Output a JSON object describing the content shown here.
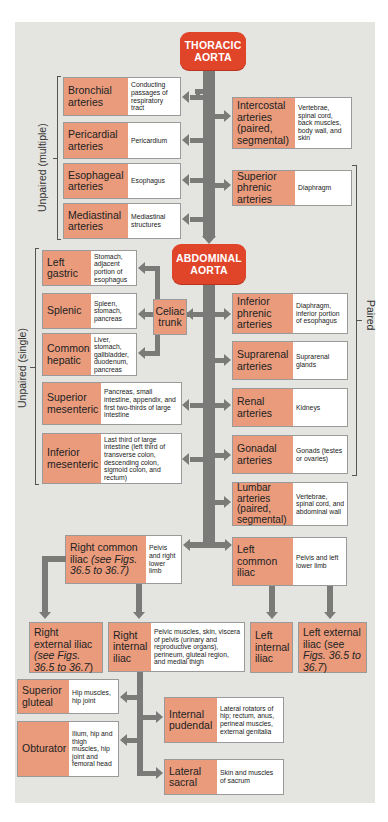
{
  "colors": {
    "aorta_fill": "#e0452a",
    "artery_name_fill": "#e99b7c",
    "description_fill": "#ffffff",
    "arrow": "#7a7a78",
    "background_panel": "#e4e4e0"
  },
  "thoracic_aorta": {
    "label_line1": "THORACIC",
    "label_line2": "AORTA"
  },
  "abdominal_aorta": {
    "label_line1": "ABDOMINAL",
    "label_line2": "AORTA"
  },
  "group_labels": {
    "unpaired_multiple": "Unpaired (multiple)",
    "unpaired_single": "Unpaired (single)",
    "paired": "Paired"
  },
  "thoracic_left": [
    {
      "name": "Bronchial arteries",
      "supplies": "Conducting passages of respiratory tract"
    },
    {
      "name": "Pericardial arteries",
      "supplies": "Pericardium"
    },
    {
      "name": "Esophageal arteries",
      "supplies": "Esophagus"
    },
    {
      "name": "Mediastinal arteries",
      "supplies": "Mediastinal structures"
    }
  ],
  "thoracic_right": [
    {
      "name": "Intercostal arteries (paired, segmental)",
      "supplies": "Vertebrae, spinal cord, back muscles, body wall, and skin"
    },
    {
      "name": "Superior phrenic arteries",
      "supplies": "Diaphragm"
    }
  ],
  "celiac_trunk": {
    "label": "Celiac trunk"
  },
  "celiac_branches": [
    {
      "name": "Left gastric",
      "supplies": "Stomach, adjacent portion of esophagus"
    },
    {
      "name": "Splenic",
      "supplies": "Spleen, stomach, pancreas"
    },
    {
      "name": "Common hepatic",
      "supplies": "Liver, stomach, gallbladder, duodenum, pancreas"
    }
  ],
  "abdominal_left": [
    {
      "name": "Superior mesenteric",
      "supplies": "Pancreas, small intestine, appendix, and first two-thirds of large intestine"
    },
    {
      "name": "Inferior mesenteric",
      "supplies": "Last third of large intestine (left third of transverse colon, descending colon, sigmoid colon, and rectum)"
    }
  ],
  "abdominal_right": [
    {
      "name": "Inferior phrenic arteries",
      "supplies": "Diaphragm, inferior portion of esophagus"
    },
    {
      "name": "Suprarenal arteries",
      "supplies": "Suprarenal glands"
    },
    {
      "name": "Renal arteries",
      "supplies": "Kidneys"
    },
    {
      "name": "Gonadal arteries",
      "supplies": "Gonads (testes or ovaries)"
    },
    {
      "name": "Lumbar arteries (paired, segmental)",
      "supplies": "Vertebrae, spinal cord, and abdominal wall"
    }
  ],
  "common_iliacs": {
    "right": {
      "name": "Right common",
      "name_cont": "iliac ",
      "ref": "(see Figs. 36.5 to 36.7)",
      "supplies": "Pelvis and right lower limb"
    },
    "left": {
      "name": "Left common iliac",
      "supplies": "Pelvis and left lower limb"
    }
  },
  "iliac_branches": {
    "right_external": {
      "name": "Right external iliac ",
      "ref_prefix": "(see ",
      "ref_italic": "Figs. 36.5 to 36.7",
      "ref_suffix": ")"
    },
    "right_internal": {
      "name": "Right internal iliac",
      "supplies": "Pelvic muscles, skin, viscera of pelvis (urinary and reproductive organs), perineum, gluteal region, and medial thigh"
    },
    "left_internal": {
      "name": "Left internal iliac"
    },
    "left_external": {
      "name": "Left external iliac ",
      "ref_prefix": "(see ",
      "ref_italic": "Figs. 36.5 to 36.7",
      "ref_suffix": ")"
    }
  },
  "internal_iliac_branches": [
    {
      "name": "Superior gluteal",
      "supplies": "Hip muscles, hip joint"
    },
    {
      "name": "Obturator",
      "supplies": "Ilium, hip and thigh muscles, hip joint and femoral head"
    },
    {
      "name": "Internal pudendal",
      "supplies": "Lateral rotators of hip; rectum, anus, perineal muscles, external genitalia"
    },
    {
      "name": "Lateral sacral",
      "supplies": "Skin and muscles of sacrum"
    }
  ]
}
